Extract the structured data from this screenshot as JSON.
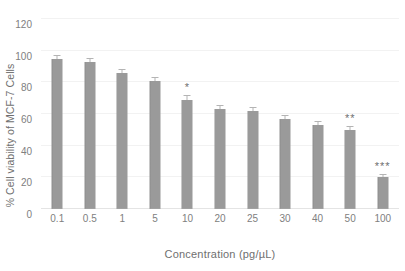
{
  "chart_data": {
    "type": "bar",
    "title": "",
    "xlabel": "Concentration (pg/µL)",
    "ylabel": "% Cell viability of MCF-7 Cells",
    "categories": [
      "0.1",
      "0.5",
      "1",
      "5",
      "10",
      "20",
      "25",
      "30",
      "40",
      "50",
      "100"
    ],
    "values": [
      95,
      93,
      86,
      81,
      69,
      63,
      62,
      57,
      53,
      50,
      20
    ],
    "errors": [
      1.5,
      2.0,
      2.0,
      1.5,
      2.5,
      2.0,
      2.0,
      1.5,
      2.0,
      1.5,
      1.5
    ],
    "annotations": [
      "",
      "",
      "",
      "",
      "*",
      "",
      "",
      "",
      "",
      "**",
      "***"
    ],
    "ylim": [
      0,
      120
    ],
    "yticks": [
      0,
      20,
      40,
      60,
      80,
      100,
      120
    ],
    "ytick_labels": [
      "0",
      "20",
      "40",
      "60",
      "80",
      "100",
      "120"
    ],
    "grid": true,
    "legend": false,
    "bar_color": "#9a9a9a",
    "gridline_color": "#f2f2f2",
    "text_color": "#808080"
  }
}
